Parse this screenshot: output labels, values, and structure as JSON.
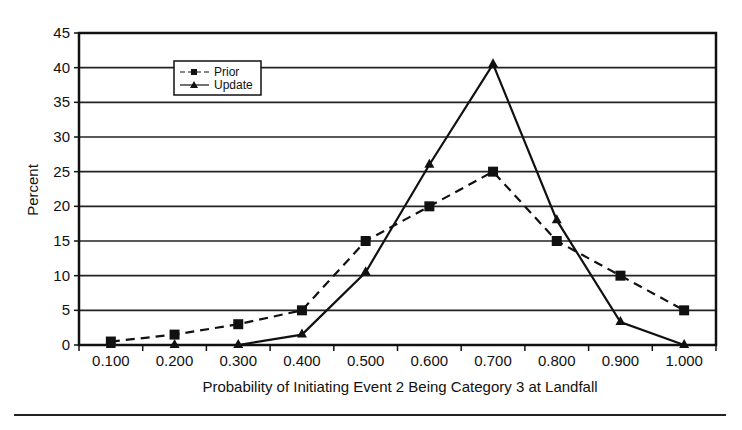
{
  "chart_data": {
    "type": "line",
    "title": "",
    "xlabel": "Probability of Initiating Event 2 Being Category 3 at Landfall",
    "ylabel": "Percent",
    "categories": [
      "0.100",
      "0.200",
      "0.300",
      "0.400",
      "0.500",
      "0.600",
      "0.700",
      "0.800",
      "0.900",
      "1.000"
    ],
    "series": [
      {
        "name": "Prior",
        "marker": "square",
        "line": "dashed",
        "values": [
          0.5,
          1.5,
          3,
          5,
          15,
          20,
          25,
          15,
          10,
          5
        ]
      },
      {
        "name": "Update",
        "marker": "triangle",
        "line": "solid",
        "values": [
          0,
          0,
          0,
          1.5,
          10.5,
          26,
          40.5,
          18,
          3.3,
          0
        ]
      }
    ],
    "yticks": [
      "0",
      "5",
      "10",
      "15",
      "20",
      "25",
      "30",
      "35",
      "40",
      "45"
    ],
    "ylim": [
      0,
      45
    ],
    "grid": "horizontal",
    "legend_position": "upper-left inside"
  },
  "colors": {
    "line": "#111111",
    "grid": "#222222",
    "background": "#ffffff"
  }
}
